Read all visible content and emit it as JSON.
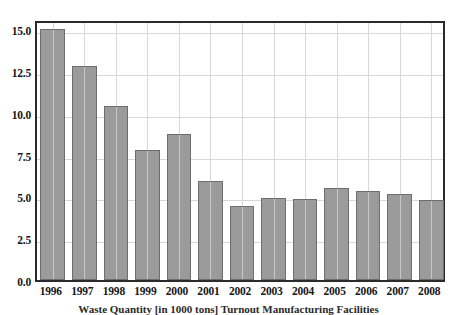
{
  "chart_data": {
    "type": "bar",
    "title": "",
    "caption": "Waste Quantity [in 1000 tons] Turnout Manufacturing Facilities",
    "xlabel": "",
    "ylabel": "",
    "categories": [
      "1996",
      "1997",
      "1998",
      "1999",
      "2000",
      "2001",
      "2002",
      "2003",
      "2004",
      "2005",
      "2006",
      "2007",
      "2008"
    ],
    "values": [
      15.0,
      12.8,
      10.4,
      7.8,
      8.7,
      5.9,
      4.4,
      4.9,
      4.85,
      5.5,
      5.3,
      5.15,
      4.8
    ],
    "ylim": [
      0.0,
      15.6
    ],
    "yticks": [
      0.0,
      2.5,
      5.0,
      7.5,
      10.0,
      12.5,
      15.0
    ],
    "ytick_labels": [
      "0.0",
      "2.5",
      "5.0",
      "7.5",
      "10.0",
      "12.5",
      "15.0"
    ],
    "grid": true,
    "legend": "none",
    "series_name": "Waste Quantity",
    "bar_color": "#9b9b9b",
    "bar_edge_color": "#6e6e6e",
    "grid_color": "#d8d8d8",
    "frame_color": "#2b2b2b"
  }
}
